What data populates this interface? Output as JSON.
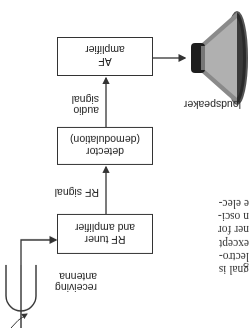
{
  "orientation": "rotated-180",
  "diagram": {
    "blocks": [
      {
        "id": "rf",
        "lines": [
          "RF tuner",
          "and amplifier"
        ]
      },
      {
        "id": "detector",
        "lines": [
          "detector",
          "(demodulation)"
        ]
      },
      {
        "id": "af",
        "lines": [
          "AF",
          "amplifier"
        ]
      }
    ],
    "signals": {
      "rf_signal": "RF signal",
      "audio_signal": [
        "audio",
        "signal"
      ]
    },
    "antenna_label": [
      "receiving",
      "antenna"
    ],
    "speaker_label": "loudspeaker"
  },
  "partial_text": {
    "lines": [
      "gnal is",
      "lectro-",
      "except",
      "ner for",
      "n osci-",
      "e elec-"
    ]
  }
}
